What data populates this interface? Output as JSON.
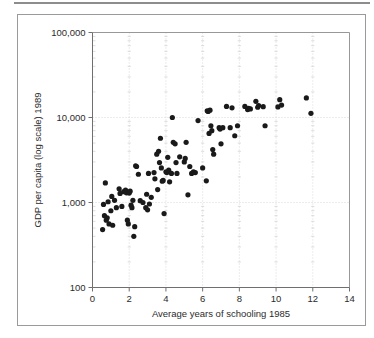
{
  "figure": {
    "background_color": "#ffffff",
    "frame_color": "#9a9a9a",
    "rule_color": "#8d8d8d"
  },
  "chart_data": {
    "type": "scatter",
    "title": "",
    "xlabel": "Average years of schooling 1985",
    "ylabel": "GDP per capita (log scale) 1989",
    "xlim": [
      0,
      14
    ],
    "ylim": [
      100,
      100000
    ],
    "yscale": "log",
    "xscale": "linear",
    "grid": true,
    "legend": null,
    "marker_color": "#1a1a1a",
    "marker_shape": "circle",
    "xticks": [
      0,
      2,
      4,
      6,
      8,
      10,
      12,
      14
    ],
    "xtick_labels": [
      "0",
      "2",
      "4",
      "6",
      "8",
      "10",
      "12",
      "14"
    ],
    "yticks": [
      100,
      1000,
      10000,
      100000
    ],
    "ytick_labels": [
      "100",
      "1,000",
      "10,000",
      "100,000"
    ],
    "n_points": 96,
    "points": [
      [
        0.55,
        480
      ],
      [
        0.6,
        950
      ],
      [
        0.65,
        700
      ],
      [
        0.7,
        1700
      ],
      [
        0.75,
        620
      ],
      [
        0.8,
        660
      ],
      [
        0.85,
        1020
      ],
      [
        0.9,
        560
      ],
      [
        1.0,
        800
      ],
      [
        1.05,
        1180
      ],
      [
        1.1,
        540
      ],
      [
        1.2,
        1060
      ],
      [
        1.3,
        870
      ],
      [
        1.45,
        1450
      ],
      [
        1.5,
        1280
      ],
      [
        1.6,
        900
      ],
      [
        1.7,
        1340
      ],
      [
        1.8,
        1400
      ],
      [
        1.85,
        1300
      ],
      [
        1.9,
        620
      ],
      [
        1.95,
        560
      ],
      [
        2.0,
        1290
      ],
      [
        2.05,
        1360
      ],
      [
        2.1,
        930
      ],
      [
        2.15,
        870
      ],
      [
        2.2,
        1060
      ],
      [
        2.25,
        400
      ],
      [
        2.3,
        520
      ],
      [
        2.35,
        2700
      ],
      [
        2.4,
        2650
      ],
      [
        2.5,
        2150
      ],
      [
        2.6,
        1050
      ],
      [
        2.75,
        1000
      ],
      [
        2.9,
        870
      ],
      [
        2.95,
        1250
      ],
      [
        3.0,
        820
      ],
      [
        3.05,
        2200
      ],
      [
        3.1,
        960
      ],
      [
        3.2,
        1150
      ],
      [
        3.35,
        2250
      ],
      [
        3.4,
        1900
      ],
      [
        3.5,
        3700
      ],
      [
        3.55,
        1420
      ],
      [
        3.6,
        4000
      ],
      [
        3.65,
        2950
      ],
      [
        3.7,
        5700
      ],
      [
        3.75,
        2550
      ],
      [
        3.8,
        1780
      ],
      [
        3.85,
        1820
      ],
      [
        3.9,
        740
      ],
      [
        4.0,
        2300
      ],
      [
        4.05,
        2250
      ],
      [
        4.1,
        3400
      ],
      [
        4.15,
        2400
      ],
      [
        4.2,
        1750
      ],
      [
        4.3,
        2200
      ],
      [
        4.35,
        10000
      ],
      [
        4.4,
        5100
      ],
      [
        4.5,
        4900
      ],
      [
        4.55,
        2950
      ],
      [
        4.6,
        2200
      ],
      [
        4.75,
        3450
      ],
      [
        5.0,
        3000
      ],
      [
        5.05,
        3300
      ],
      [
        5.1,
        5100
      ],
      [
        5.2,
        1230
      ],
      [
        5.3,
        2650
      ],
      [
        5.4,
        2200
      ],
      [
        5.5,
        2300
      ],
      [
        5.6,
        2250
      ],
      [
        5.75,
        9200
      ],
      [
        6.0,
        2550
      ],
      [
        6.2,
        1800
      ],
      [
        6.25,
        12000
      ],
      [
        6.3,
        11800
      ],
      [
        6.35,
        6500
      ],
      [
        6.4,
        12200
      ],
      [
        6.45,
        8000
      ],
      [
        6.5,
        7000
      ],
      [
        6.55,
        4200
      ],
      [
        6.6,
        3700
      ],
      [
        6.9,
        7600
      ],
      [
        6.95,
        7300
      ],
      [
        7.0,
        4900
      ],
      [
        7.1,
        7600
      ],
      [
        7.3,
        13500
      ],
      [
        7.5,
        7600
      ],
      [
        7.6,
        13000
      ],
      [
        7.75,
        6100
      ],
      [
        7.9,
        8000
      ],
      [
        8.3,
        13500
      ],
      [
        8.45,
        12400
      ],
      [
        8.5,
        12800
      ],
      [
        8.6,
        12600
      ],
      [
        8.9,
        15500
      ],
      [
        9.0,
        13200
      ],
      [
        9.05,
        13800
      ],
      [
        9.3,
        13400
      ],
      [
        9.4,
        8000
      ],
      [
        10.1,
        13300
      ],
      [
        10.2,
        16200
      ],
      [
        10.3,
        14000
      ],
      [
        11.65,
        17000
      ],
      [
        11.9,
        11200
      ]
    ]
  }
}
